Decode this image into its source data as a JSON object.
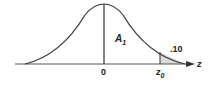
{
  "diagram": {
    "type": "standard-normal-distribution",
    "labels": {
      "center_tick": "0",
      "area_label": "A",
      "area_subscript": "1",
      "tail_area": ".10",
      "critical_value": "z",
      "critical_subscript": "0",
      "axis_label": "z"
    },
    "colors": {
      "curve": "#333333",
      "axis": "#555555",
      "tail_fill": "#d9d9d9"
    }
  }
}
